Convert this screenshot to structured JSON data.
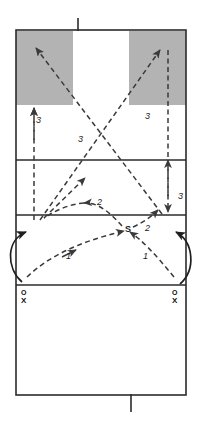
{
  "diagram": {
    "type": "court-diagram",
    "sport": "volleyball"
  },
  "colors": {
    "line": "#2b2b2b",
    "shaded_zone": "#b3b3b3",
    "dashed_path": "#3a3a3a",
    "solid_path": "#1f1f1f",
    "background": "#ffffff",
    "text": "#1a1a1a"
  },
  "court": {
    "left": 16,
    "right": 186,
    "top": 30,
    "bottom": 395,
    "lines": [
      {
        "name": "net-line",
        "y": 30
      },
      {
        "name": "far-attack-line",
        "y": 160
      },
      {
        "name": "near-attack-line",
        "y": 215
      },
      {
        "name": "center-line",
        "y": 285
      },
      {
        "name": "end-line",
        "y": 395
      }
    ],
    "antenna_top": {
      "x": 78,
      "y_from": 18,
      "y_to": 30
    },
    "service_mark_bottom": {
      "x": 131,
      "y_from": 395,
      "y_to": 412
    }
  },
  "target_zones": [
    {
      "name": "left-target-zone",
      "x": 16,
      "y": 33,
      "width": 57,
      "height": 72
    },
    {
      "name": "right-target-zone",
      "x": 129,
      "y": 33,
      "width": 57,
      "height": 72
    }
  ],
  "players": [
    {
      "name": "left-player-stack",
      "x": 25,
      "y": 288,
      "top_label": "O",
      "bottom_label": "X"
    },
    {
      "name": "right-player-stack",
      "x": 176,
      "y": 288,
      "top_label": "O",
      "bottom_label": "X"
    }
  ],
  "setter": {
    "label": "S",
    "x": 126,
    "y": 229
  },
  "path_labels": [
    {
      "name": "pass-label-left",
      "text": "1",
      "x": 66,
      "y": 257
    },
    {
      "name": "pass-label-right",
      "text": "1",
      "x": 143,
      "y": 257
    },
    {
      "name": "set-label-left",
      "text": "2",
      "x": 97,
      "y": 205
    },
    {
      "name": "set-label-right",
      "text": "2",
      "x": 145,
      "y": 229
    },
    {
      "name": "attack-label-left",
      "text": "3",
      "x": 36,
      "y": 122
    },
    {
      "name": "attack-label-mid",
      "text": "3",
      "x": 78,
      "y": 141
    },
    {
      "name": "attack-label-right",
      "text": "3",
      "x": 145,
      "y": 118
    },
    {
      "name": "attack-label-far-right",
      "text": "3",
      "x": 179,
      "y": 198
    }
  ],
  "legend_keys": {
    "1": "pass",
    "2": "set",
    "3": "attack",
    "S": "setter",
    "O": "player-position-o",
    "X": "player-position-x"
  }
}
